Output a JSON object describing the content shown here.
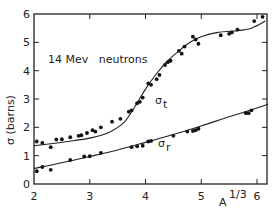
{
  "chart_data": {
    "type": "scatter",
    "title": "",
    "annotation": "14 Mev   neutrons",
    "xlabel": "A",
    "xlabel_superscript": "1/3",
    "ylabel": "σ (barns)",
    "xlim": [
      2,
      6.2
    ],
    "ylim": [
      0,
      6
    ],
    "xticks": [
      2,
      3,
      4,
      5,
      6
    ],
    "yticks": [
      0,
      1,
      2,
      3,
      4,
      5,
      6
    ],
    "grid": false,
    "legend": "none",
    "series": [
      {
        "name": "σt",
        "label_text": "σ",
        "label_sub": "t",
        "curve": [
          [
            2.0,
            1.35
          ],
          [
            2.3,
            1.42
          ],
          [
            2.6,
            1.5
          ],
          [
            3.0,
            1.62
          ],
          [
            3.3,
            1.78
          ],
          [
            3.6,
            2.15
          ],
          [
            3.8,
            2.7
          ],
          [
            4.0,
            3.35
          ],
          [
            4.2,
            3.9
          ],
          [
            4.4,
            4.35
          ],
          [
            4.6,
            4.7
          ],
          [
            4.8,
            5.0
          ],
          [
            5.0,
            5.2
          ],
          [
            5.3,
            5.35
          ],
          [
            5.6,
            5.4
          ],
          [
            5.9,
            5.5
          ],
          [
            6.15,
            5.75
          ]
        ],
        "points": [
          [
            2.05,
            1.5
          ],
          [
            2.15,
            1.45
          ],
          [
            2.3,
            1.3
          ],
          [
            2.4,
            1.57
          ],
          [
            2.5,
            1.58
          ],
          [
            2.65,
            1.65
          ],
          [
            2.8,
            1.7
          ],
          [
            2.85,
            1.72
          ],
          [
            2.95,
            1.8
          ],
          [
            3.05,
            1.9
          ],
          [
            3.1,
            1.85
          ],
          [
            3.2,
            2.0
          ],
          [
            3.4,
            2.2
          ],
          [
            3.55,
            2.3
          ],
          [
            3.7,
            2.55
          ],
          [
            3.75,
            2.6
          ],
          [
            3.85,
            2.85
          ],
          [
            3.9,
            2.9
          ],
          [
            3.95,
            3.05
          ],
          [
            4.05,
            3.55
          ],
          [
            4.1,
            3.5
          ],
          [
            4.2,
            3.7
          ],
          [
            4.25,
            3.85
          ],
          [
            4.35,
            4.2
          ],
          [
            4.4,
            4.3
          ],
          [
            4.45,
            4.35
          ],
          [
            4.6,
            4.7
          ],
          [
            4.65,
            4.6
          ],
          [
            4.7,
            4.85
          ],
          [
            4.85,
            5.2
          ],
          [
            4.9,
            5.1
          ],
          [
            4.95,
            4.95
          ],
          [
            5.35,
            5.25
          ],
          [
            5.5,
            5.3
          ],
          [
            5.55,
            5.35
          ],
          [
            5.65,
            5.45
          ],
          [
            5.95,
            5.75
          ],
          [
            6.1,
            5.9
          ]
        ]
      },
      {
        "name": "σr",
        "label_text": "σ",
        "label_sub": "r",
        "curve": [
          [
            2.0,
            0.55
          ],
          [
            2.5,
            0.75
          ],
          [
            3.0,
            0.97
          ],
          [
            3.5,
            1.2
          ],
          [
            4.0,
            1.47
          ],
          [
            4.5,
            1.75
          ],
          [
            5.0,
            2.05
          ],
          [
            5.5,
            2.37
          ],
          [
            6.0,
            2.68
          ],
          [
            6.2,
            2.82
          ]
        ],
        "points": [
          [
            2.05,
            0.45
          ],
          [
            2.15,
            0.6
          ],
          [
            2.3,
            0.5
          ],
          [
            2.65,
            0.85
          ],
          [
            2.9,
            0.97
          ],
          [
            3.0,
            0.98
          ],
          [
            3.2,
            1.1
          ],
          [
            3.75,
            1.3
          ],
          [
            3.85,
            1.33
          ],
          [
            3.95,
            1.35
          ],
          [
            4.05,
            1.5
          ],
          [
            4.1,
            1.52
          ],
          [
            4.5,
            1.7
          ],
          [
            4.75,
            1.85
          ],
          [
            4.85,
            1.87
          ],
          [
            4.9,
            1.9
          ],
          [
            4.95,
            1.95
          ],
          [
            5.8,
            2.5
          ],
          [
            5.85,
            2.5
          ],
          [
            5.9,
            2.6
          ]
        ]
      }
    ]
  }
}
